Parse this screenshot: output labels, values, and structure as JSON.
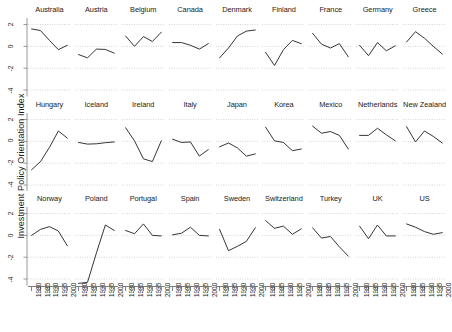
{
  "chart_data": {
    "type": "line",
    "title": "",
    "xlabel": "",
    "ylabel": "Investment Policy Orientation Index",
    "layout": "trellis 9 columns x 3 rows, one panel per country",
    "grid": true,
    "legend": "none",
    "x": [
      1980,
      1985,
      1990,
      1995,
      2000
    ],
    "xticklabels": [
      "1980",
      "1985",
      "1990",
      "1995",
      "2000"
    ],
    "xlim": [
      1978,
      2002
    ],
    "yticks": [
      2,
      0,
      -2,
      -4
    ],
    "yticklabels": [
      "2",
      "0",
      "-2",
      "-4"
    ],
    "ylim": [
      -4.6,
      2.6
    ],
    "line_color": "#2a2a2a",
    "grid_color": "#b9b9b9",
    "series": [
      {
        "name": "Australia",
        "values": [
          1.6,
          1.45,
          0.55,
          -0.3,
          0.1
        ]
      },
      {
        "name": "Austria",
        "values": [
          -0.75,
          -1.05,
          -0.25,
          -0.28,
          -0.62
        ]
      },
      {
        "name": "Belgium",
        "values": [
          0.95,
          0.0,
          0.9,
          0.45,
          1.3
        ]
      },
      {
        "name": "Canada",
        "values": [
          0.35,
          0.35,
          0.1,
          -0.25,
          0.25
        ]
      },
      {
        "name": "Denmark",
        "values": [
          -1.05,
          -0.15,
          0.95,
          1.4,
          1.5
        ]
      },
      {
        "name": "Finland",
        "values": [
          -0.55,
          -1.75,
          -0.3,
          0.55,
          0.25
        ]
      },
      {
        "name": "France",
        "values": [
          1.2,
          0.2,
          -0.15,
          0.25,
          -0.95
        ]
      },
      {
        "name": "Germany",
        "values": [
          0.1,
          -0.85,
          0.35,
          -0.4,
          0.05
        ]
      },
      {
        "name": "Greece",
        "values": [
          0.4,
          1.35,
          0.75,
          0.0,
          -0.7
        ]
      },
      {
        "name": "Hungary",
        "values": [
          -2.6,
          -1.85,
          -0.55,
          0.95,
          0.3
        ]
      },
      {
        "name": "Iceland",
        "values": [
          -0.1,
          -0.25,
          -0.22,
          -0.12,
          -0.05
        ]
      },
      {
        "name": "Ireland",
        "values": [
          1.25,
          0.05,
          -1.6,
          -1.85,
          0.05
        ]
      },
      {
        "name": "Italy",
        "values": [
          0.2,
          -0.1,
          -0.05,
          -1.35,
          -0.75
        ]
      },
      {
        "name": "Japan",
        "values": [
          -0.5,
          -0.15,
          -0.6,
          -1.35,
          -1.15
        ]
      },
      {
        "name": "Korea",
        "values": [
          1.3,
          0.05,
          -0.1,
          -0.85,
          -0.7
        ]
      },
      {
        "name": "Mexico",
        "values": [
          1.4,
          0.75,
          0.9,
          0.55,
          -0.7
        ]
      },
      {
        "name": "Netherlands",
        "values": [
          0.55,
          0.55,
          1.2,
          0.6,
          0.05
        ]
      },
      {
        "name": "New Zealand",
        "values": [
          1.35,
          -0.05,
          0.95,
          0.45,
          -0.15
        ]
      },
      {
        "name": "Norway",
        "values": [
          0.0,
          0.55,
          0.8,
          0.4,
          -0.95
        ]
      },
      {
        "name": "Poland",
        "values": [
          -4.4,
          -4.3,
          -1.6,
          0.95,
          0.45
        ]
      },
      {
        "name": "Portugal",
        "values": [
          0.45,
          0.15,
          1.05,
          0.0,
          -0.05
        ]
      },
      {
        "name": "Spain",
        "values": [
          0.05,
          0.2,
          0.75,
          0.0,
          -0.05
        ]
      },
      {
        "name": "Sweden",
        "values": [
          0.55,
          -1.4,
          -1.0,
          -0.55,
          0.7
        ]
      },
      {
        "name": "Switzerland",
        "values": [
          1.35,
          0.65,
          0.85,
          0.1,
          0.6
        ]
      },
      {
        "name": "Turkey",
        "values": [
          0.7,
          -0.25,
          -0.1,
          -1.05,
          -1.9
        ]
      },
      {
        "name": "UK",
        "values": [
          0.85,
          -0.3,
          0.95,
          -0.05,
          -0.05
        ]
      },
      {
        "name": "US",
        "values": [
          1.05,
          0.75,
          0.35,
          0.1,
          0.25
        ]
      }
    ]
  }
}
